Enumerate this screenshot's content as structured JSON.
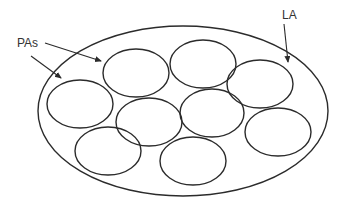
{
  "labels": {
    "pas": "PAs",
    "la": "LA"
  },
  "colors": {
    "stroke": "#2b2b2b",
    "text": "#333333",
    "background": "#ffffff"
  },
  "outer_ellipse": {
    "name": "LA",
    "cx": 183,
    "cy": 111,
    "rx": 145,
    "ry": 85
  },
  "inner_ellipses": [
    {
      "name": "PA",
      "cx": 80,
      "cy": 104,
      "rx": 33,
      "ry": 24
    },
    {
      "name": "PA",
      "cx": 136,
      "cy": 73,
      "rx": 33,
      "ry": 24
    },
    {
      "name": "PA",
      "cx": 203,
      "cy": 64,
      "rx": 33,
      "ry": 24
    },
    {
      "name": "PA",
      "cx": 260,
      "cy": 84,
      "rx": 33,
      "ry": 24
    },
    {
      "name": "PA",
      "cx": 149,
      "cy": 122,
      "rx": 33,
      "ry": 24
    },
    {
      "name": "PA",
      "cx": 212,
      "cy": 113,
      "rx": 32,
      "ry": 24
    },
    {
      "name": "PA",
      "cx": 278,
      "cy": 132,
      "rx": 33,
      "ry": 24
    },
    {
      "name": "PA",
      "cx": 108,
      "cy": 151,
      "rx": 33,
      "ry": 24
    },
    {
      "name": "PA",
      "cx": 193,
      "cy": 161,
      "rx": 33,
      "ry": 24
    }
  ]
}
